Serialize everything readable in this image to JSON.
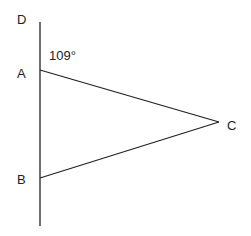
{
  "diagram": {
    "labels": {
      "D": "D",
      "A": "A",
      "B": "B",
      "C": "C",
      "angle": "109°"
    },
    "points": {
      "D": [
        40,
        22
      ],
      "A": [
        40,
        70
      ],
      "B": [
        40,
        178
      ],
      "C": [
        219,
        122
      ],
      "end": [
        40,
        226
      ]
    },
    "line_color": "#222222"
  }
}
